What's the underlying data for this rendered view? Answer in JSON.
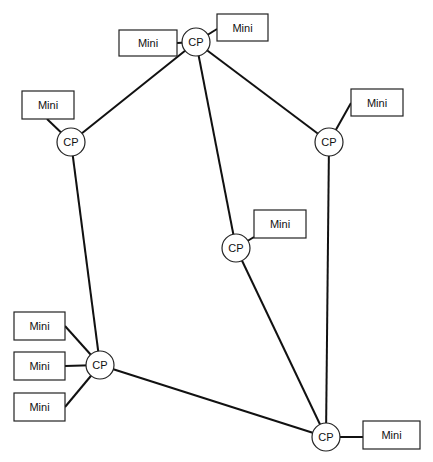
{
  "diagram": {
    "type": "network topology",
    "node_label_cp": "CP",
    "node_label_mini": "Mini",
    "cp_nodes": [
      {
        "id": "cp_top",
        "label": "CP",
        "cx": 196,
        "cy": 42
      },
      {
        "id": "cp_left",
        "label": "CP",
        "cx": 71,
        "cy": 142
      },
      {
        "id": "cp_right",
        "label": "CP",
        "cx": 329,
        "cy": 142
      },
      {
        "id": "cp_middle",
        "label": "CP",
        "cx": 236,
        "cy": 248
      },
      {
        "id": "cp_bottom_left",
        "label": "CP",
        "cx": 100,
        "cy": 365
      },
      {
        "id": "cp_bottom_right",
        "label": "CP",
        "cx": 326,
        "cy": 437
      }
    ],
    "mini_nodes": [
      {
        "id": "mini_top_left",
        "label": "Mini",
        "attached_to": "cp_top"
      },
      {
        "id": "mini_top_right",
        "label": "Mini",
        "attached_to": "cp_top"
      },
      {
        "id": "mini_left",
        "label": "Mini",
        "attached_to": "cp_left"
      },
      {
        "id": "mini_right",
        "label": "Mini",
        "attached_to": "cp_right"
      },
      {
        "id": "mini_middle",
        "label": "Mini",
        "attached_to": "cp_middle"
      },
      {
        "id": "mini_bl_1",
        "label": "Mini",
        "attached_to": "cp_bottom_left"
      },
      {
        "id": "mini_bl_2",
        "label": "Mini",
        "attached_to": "cp_bottom_left"
      },
      {
        "id": "mini_bl_3",
        "label": "Mini",
        "attached_to": "cp_bottom_left"
      },
      {
        "id": "mini_bottom_right",
        "label": "Mini",
        "attached_to": "cp_bottom_right"
      }
    ],
    "cp_links": [
      [
        "cp_top",
        "cp_left"
      ],
      [
        "cp_top",
        "cp_right"
      ],
      [
        "cp_top",
        "cp_middle"
      ],
      [
        "cp_left",
        "cp_bottom_left"
      ],
      [
        "cp_right",
        "cp_bottom_right"
      ],
      [
        "cp_middle",
        "cp_bottom_right"
      ],
      [
        "cp_bottom_left",
        "cp_bottom_right"
      ]
    ]
  }
}
